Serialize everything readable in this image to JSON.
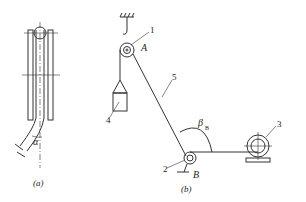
{
  "figure": {
    "panel_a": {
      "caption": "(a)",
      "angle_label": "α"
    },
    "panel_b": {
      "caption": "(b)",
      "labels": {
        "pulley_A": "A",
        "pulley_B": "B",
        "angle": "β",
        "angle_sub": "B"
      },
      "parts": [
        "1",
        "2",
        "3",
        "4",
        "5"
      ]
    }
  }
}
